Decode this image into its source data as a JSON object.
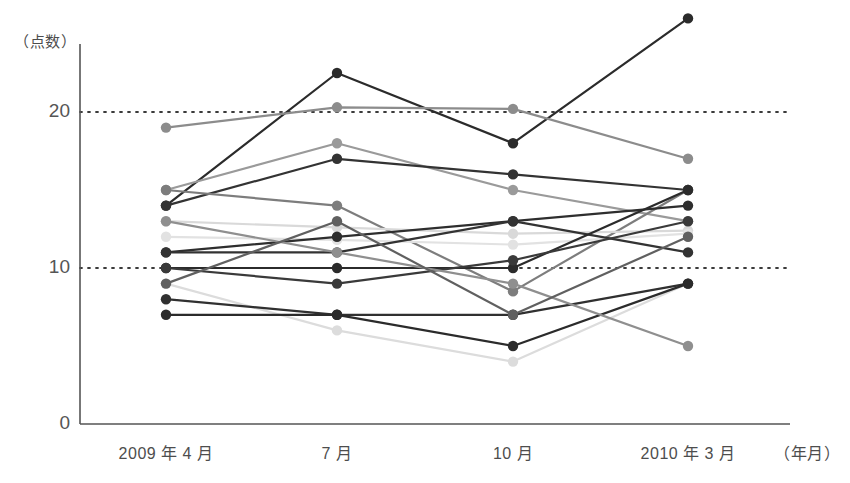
{
  "chart_data": {
    "type": "line",
    "title": "",
    "subtitle": "",
    "ylabel": "（点数）",
    "xlabel": "（年月）",
    "categories": [
      "2009 年 4 月",
      "7 月",
      "10 月",
      "2010 年 3 月"
    ],
    "x_axis_unit": "（年月）",
    "y_axis_unit": "（点数）",
    "ylim": [
      0,
      27
    ],
    "yticks": [
      0,
      10,
      20
    ],
    "ytick_labels": [
      "0",
      "10",
      "20"
    ],
    "gridlines": [
      10,
      20
    ],
    "grid": "dotted-horizontal",
    "legend": "none",
    "series": [
      {
        "name": "series-1",
        "color": "#2b2b2b",
        "values": [
          14,
          22.5,
          18,
          26
        ]
      },
      {
        "name": "series-2",
        "color": "#8c8c8c",
        "values": [
          19,
          20.3,
          20.2,
          17
        ]
      },
      {
        "name": "series-3",
        "color": "#9a9a9a",
        "values": [
          15,
          18,
          15,
          13
        ]
      },
      {
        "name": "series-4",
        "color": "#333333",
        "values": [
          14,
          17,
          16,
          15
        ]
      },
      {
        "name": "series-5",
        "color": "#7d7d7d",
        "values": [
          15,
          14,
          8.5,
          15
        ]
      },
      {
        "name": "series-6",
        "color": "#d9d9d9",
        "values": [
          13,
          12.6,
          12.2,
          12.4
        ]
      },
      {
        "name": "series-7",
        "color": "#e2e2e2",
        "values": [
          12,
          11.8,
          11.5,
          12.2
        ]
      },
      {
        "name": "series-8",
        "color": "#2e2e2e",
        "values": [
          11,
          12,
          13,
          14
        ]
      },
      {
        "name": "series-9",
        "color": "#333333",
        "values": [
          11,
          11,
          13,
          11
        ]
      },
      {
        "name": "series-10",
        "color": "#2b2b2b",
        "values": [
          10,
          10,
          10,
          15
        ]
      },
      {
        "name": "series-11",
        "color": "#3a3a3a",
        "values": [
          10,
          9,
          10.5,
          13
        ]
      },
      {
        "name": "series-12",
        "color": "#dcdcdc",
        "values": [
          9,
          6,
          4,
          9
        ]
      },
      {
        "name": "series-13",
        "color": "#303030",
        "values": [
          8,
          7,
          7,
          9
        ]
      },
      {
        "name": "series-14",
        "color": "#2b2b2b",
        "values": [
          7,
          7,
          5,
          9
        ]
      },
      {
        "name": "series-15",
        "color": "#8f8f8f",
        "values": [
          13,
          11,
          9,
          5
        ]
      },
      {
        "name": "series-16",
        "color": "#606060",
        "values": [
          9,
          13,
          7,
          12
        ]
      }
    ]
  },
  "axis": {
    "ytick_0": "0",
    "ytick_10": "10",
    "ytick_20": "20",
    "xtick_0": "2009 年 4 月",
    "xtick_1": "7 月",
    "xtick_2": "10 月",
    "xtick_3": "2010 年 3 月",
    "y_unit": "（点数）",
    "x_unit": "（年月）"
  }
}
